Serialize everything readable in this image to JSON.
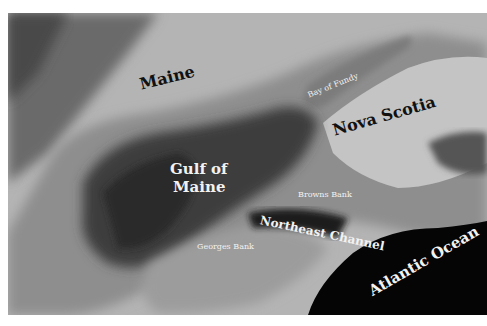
{
  "header": {
    "clipped_text": ""
  },
  "map": {
    "title": "Gulf of Maine region",
    "labels": {
      "maine": "Maine",
      "bay_of_fundy": "Bay of Fundy",
      "nova_scotia": "Nova Scotia",
      "gulf_of_maine_line1": "Gulf of",
      "gulf_of_maine_line2": "Maine",
      "browns_bank": "Browns Bank",
      "northeast_channel": "Northeast Channel",
      "georges_bank": "Georges Bank",
      "atlantic_ocean": "Atlantic Ocean"
    },
    "colors": {
      "land_light": "#bdbdbd",
      "land_dark": "#6e6e6e",
      "shelf": "#8c8c8c",
      "basin": "#3a3a3a",
      "deep_ocean": "#050505",
      "bay": "#7a7a7a"
    }
  }
}
